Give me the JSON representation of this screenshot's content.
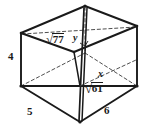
{
  "figure": {
    "kind": "geometry-diagram",
    "caption_text": "",
    "background_color": "#ffffff",
    "stroke_color": "#1a1a1a",
    "labels": {
      "height": "4",
      "base_left": "5",
      "base_right": "6",
      "vertical_diagonal": "y",
      "space_diagonal": "x",
      "top_face_diagonal_sign": "√",
      "top_face_diagonal_value": "77",
      "base_face_diagonal_sign": "√",
      "base_face_diagonal_value": "61"
    },
    "geometry": {
      "shape": "rectangular prism",
      "projection": "oblique",
      "vertices": {
        "top_back": [
          85,
          6
        ],
        "top_left": [
          21,
          33
        ],
        "top_front": [
          74,
          52
        ],
        "top_right": [
          137,
          26
        ],
        "bottom_back": [
          85,
          53
        ],
        "bottom_left": [
          21,
          86
        ],
        "bottom_front": [
          80,
          122
        ],
        "bottom_right": [
          137,
          86
        ]
      },
      "solid_edges": [
        "top_left-top_back",
        "top_back-top_right",
        "top_left-top_front",
        "top_front-top_right",
        "top_left-bottom_left",
        "top_right-bottom_right",
        "bottom_left-bottom_front",
        "bottom_front-bottom_right",
        "bottom_left-bottom_right"
      ],
      "dashed_edges": [
        "top_front-bottom_back",
        "bottom_left-bottom_back",
        "bottom_back-bottom_right"
      ],
      "interior_segments": [
        {
          "name": "vertical-diagonal-y",
          "from": "top_back",
          "to": "bottom_front",
          "style": "solid-dashed"
        },
        {
          "name": "space-diagonal-x",
          "from": "bottom_left",
          "to": "bottom_right",
          "style": "solid"
        },
        {
          "name": "top-face-diagonal-sqrt77",
          "from": "top_left",
          "to": "top_right",
          "style": "dashed"
        }
      ]
    }
  }
}
